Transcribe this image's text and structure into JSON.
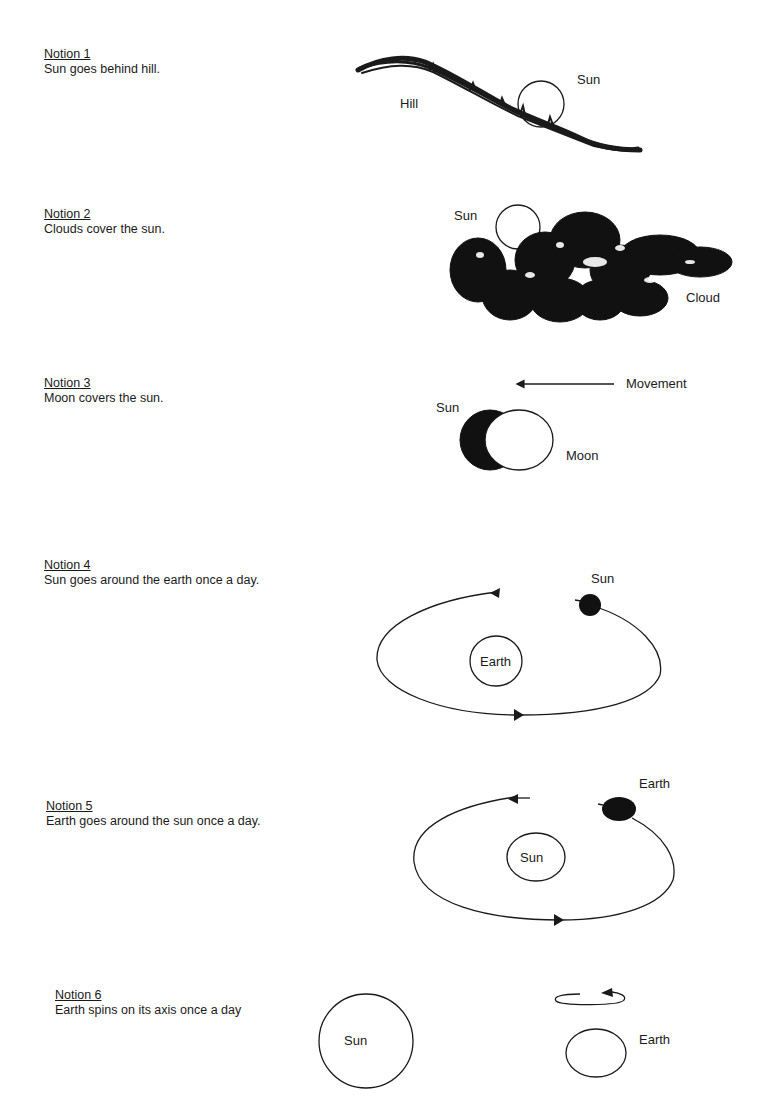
{
  "notions": [
    {
      "title": "Notion 1",
      "desc": "Sun goes behind hill."
    },
    {
      "title": "Notion 2",
      "desc": "Clouds cover the sun."
    },
    {
      "title": "Notion 3",
      "desc": "Moon covers the sun."
    },
    {
      "title": "Notion 4",
      "desc": "Sun goes around the earth once a day."
    },
    {
      "title": "Notion 5",
      "desc": "Earth goes around the sun once a day."
    },
    {
      "title": "Notion 6",
      "desc": "Earth spins on its axis once a day"
    }
  ],
  "diagrams": {
    "d1": {
      "hill_label": "Hill",
      "sun_label": "Sun"
    },
    "d2": {
      "sun_label": "Sun",
      "cloud_label": "Cloud"
    },
    "d3": {
      "movement_label": "Movement",
      "sun_label": "Sun",
      "moon_label": "Moon"
    },
    "d4": {
      "sun_label": "Sun",
      "earth_label": "Earth"
    },
    "d5": {
      "earth_label": "Earth",
      "sun_label": "Sun"
    },
    "d6": {
      "sun_label": "Sun",
      "earth_label": "Earth"
    }
  },
  "colors": {
    "ink": "#1a1a1a",
    "background": "#ffffff"
  }
}
